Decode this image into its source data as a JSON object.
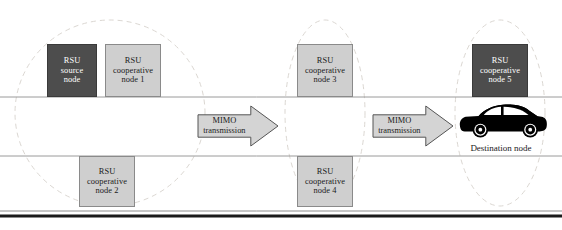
{
  "figure": {
    "colors": {
      "dark_node_fill": "#4d4d4d",
      "dark_node_text": "#ffffff",
      "light_node_fill": "#cfcfcf",
      "light_node_text": "#1a1a1a",
      "arrow_fill": "#d4d4d4",
      "arrow_stroke": "#555555",
      "ellipse_stroke": "#d8d4cf",
      "road_line": "#9a9a9a",
      "baseline_thick": "#1a1a1a",
      "car_body": "#000000",
      "car_window": "#ffffff",
      "background": "#ffffff"
    }
  },
  "nodes": [
    {
      "id": "rsu-source-node",
      "style": "dark",
      "lines": [
        "RSU",
        "source",
        "node"
      ],
      "x": 47,
      "y": 44,
      "w": 50,
      "h": 53
    },
    {
      "id": "rsu-cooperative-node-1",
      "style": "light",
      "lines": [
        "RSU",
        "cooperative",
        "node 1"
      ],
      "x": 105,
      "y": 44,
      "w": 56,
      "h": 53
    },
    {
      "id": "rsu-cooperative-node-2",
      "style": "light",
      "lines": [
        "RSU",
        "cooperative",
        "node 2"
      ],
      "x": 79,
      "y": 156,
      "w": 56,
      "h": 51
    },
    {
      "id": "rsu-cooperative-node-3",
      "style": "light",
      "lines": [
        "RSU",
        "cooperative",
        "node 3"
      ],
      "x": 297,
      "y": 44,
      "w": 56,
      "h": 53
    },
    {
      "id": "rsu-cooperative-node-4",
      "style": "light",
      "lines": [
        "RSU",
        "cooperative",
        "node 4"
      ],
      "x": 297,
      "y": 156,
      "w": 56,
      "h": 51
    },
    {
      "id": "rsu-cooperative-node-5",
      "style": "dark",
      "lines": [
        "RSU",
        "cooperative",
        "node 5"
      ],
      "x": 472,
      "y": 44,
      "w": 56,
      "h": 53
    }
  ],
  "arrows": [
    {
      "id": "mimo-transmission-arrow-1",
      "lines": [
        "MIMO",
        "transmission"
      ],
      "x": 198,
      "y": 106,
      "w": 80,
      "h": 40
    },
    {
      "id": "mimo-transmission-arrow-2",
      "lines": [
        "MIMO",
        "transmission"
      ],
      "x": 373,
      "y": 106,
      "w": 80,
      "h": 40
    }
  ],
  "clusters": [
    {
      "id": "coverage-ellipse-left",
      "cx": 110,
      "cy": 113,
      "rx": 95,
      "ry": 93
    },
    {
      "id": "coverage-ellipse-middle",
      "cx": 325,
      "cy": 113,
      "rx": 40,
      "ry": 93
    },
    {
      "id": "coverage-ellipse-right",
      "cx": 500,
      "cy": 113,
      "rx": 45,
      "ry": 93
    }
  ],
  "road": {
    "upper_line_y": 97,
    "lower_line_y": 156,
    "baseline_thin_y": 211,
    "baseline_thick_y": 216,
    "x_start": 0,
    "x_end": 562
  },
  "vehicle": {
    "id": "destination-vehicle",
    "label": "Destination node",
    "x": 458,
    "y": 103,
    "w": 86,
    "h": 38,
    "label_x": 458,
    "label_y": 143,
    "label_w": 86
  }
}
